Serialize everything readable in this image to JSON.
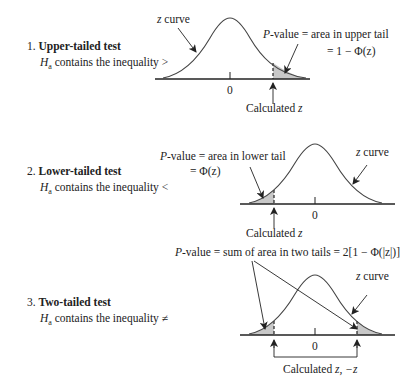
{
  "sections": [
    {
      "number": "1.",
      "title": "Upper-tailed test",
      "ha_symbol": "H",
      "ha_sub": "a",
      "ha_text": " contains the inequality >",
      "curve_label_z": "z",
      "curve_label_rest": " curve",
      "pvalue_p": "P",
      "pvalue_text": "-value = area in upper tail",
      "formula": "= 1 −  Φ(z)",
      "zero_label": "0",
      "calc_label": "Calculated ",
      "calc_var": "z"
    },
    {
      "number": "2.",
      "title": "Lower-tailed test",
      "ha_symbol": "H",
      "ha_sub": "a",
      "ha_text": " contains the inequality <",
      "curve_label_z": "z",
      "curve_label_rest": " curve",
      "pvalue_p": "P",
      "pvalue_text": "-value = area in lower tail",
      "formula": "= Φ(z)",
      "zero_label": "0",
      "calc_label": "Calculated ",
      "calc_var": "z"
    },
    {
      "number": "3.",
      "title": "Two-tailed test",
      "ha_symbol": "H",
      "ha_sub": "a",
      "ha_text": " contains the inequality ≠",
      "curve_label_z": "z",
      "curve_label_rest": " curve",
      "pvalue_p": "P",
      "pvalue_text": "-value = sum of area in two tails = 2[1 −  Φ(|z|)]",
      "zero_label": "0",
      "calc_label": "Calculated ",
      "calc_var": "z, −z"
    }
  ],
  "colors": {
    "line": "#333333",
    "shade": "#c8c8c8"
  }
}
